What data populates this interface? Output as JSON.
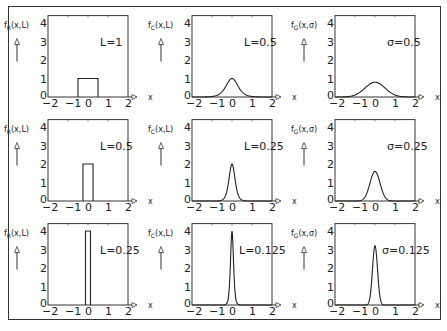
{
  "chart_data": [
    {
      "type": "line",
      "panel": "row1-col1",
      "ylabel": "f_R(x,L)",
      "xlabel": "x",
      "annotation": "L=1",
      "shape": "rect",
      "param": 1,
      "peak": 1,
      "xlim": [
        -2,
        2
      ],
      "ylim": [
        0,
        4.4
      ],
      "xticks": [
        "-2",
        "-1",
        "0",
        "1",
        "2"
      ],
      "yticks": [
        "0",
        "1",
        "2",
        "3",
        "4"
      ]
    },
    {
      "type": "line",
      "panel": "row1-col2",
      "ylabel": "f_C(x,L)",
      "xlabel": "x",
      "annotation": "L=0.5",
      "shape": "lorentz",
      "param": 0.5,
      "peak": 1,
      "xlim": [
        -2,
        2
      ],
      "ylim": [
        0,
        4.4
      ],
      "xticks": [
        "-2",
        "-1",
        "0",
        "1",
        "2"
      ],
      "yticks": [
        "0",
        "1",
        "2",
        "3",
        "4"
      ]
    },
    {
      "type": "line",
      "panel": "row1-col3",
      "ylabel": "f_G(x,σ)",
      "xlabel": "x",
      "annotation": "σ=0.5",
      "shape": "gauss",
      "param": 0.5,
      "peak": 0.8,
      "xlim": [
        -2,
        2
      ],
      "ylim": [
        0,
        4.4
      ],
      "xticks": [
        "-2",
        "-1",
        "0",
        "1",
        "2"
      ],
      "yticks": [
        "0",
        "1",
        "2",
        "3",
        "4"
      ]
    },
    {
      "type": "line",
      "panel": "row2-col1",
      "ylabel": "f_R(x,L)",
      "xlabel": "x",
      "annotation": "L=0.5",
      "shape": "rect",
      "param": 0.5,
      "peak": 2,
      "xlim": [
        -2,
        2
      ],
      "ylim": [
        0,
        4.4
      ],
      "xticks": [
        "-2",
        "-1",
        "0",
        "1",
        "2"
      ],
      "yticks": [
        "0",
        "1",
        "2",
        "3",
        "4"
      ]
    },
    {
      "type": "line",
      "panel": "row2-col2",
      "ylabel": "f_C(x,L)",
      "xlabel": "x",
      "annotation": "L=0.25",
      "shape": "lorentz",
      "param": 0.25,
      "peak": 2,
      "xlim": [
        -2,
        2
      ],
      "ylim": [
        0,
        4.4
      ],
      "xticks": [
        "-2",
        "-1",
        "0",
        "1",
        "2"
      ],
      "yticks": [
        "0",
        "1",
        "2",
        "3",
        "4"
      ]
    },
    {
      "type": "line",
      "panel": "row2-col3",
      "ylabel": "f_G(x,σ)",
      "xlabel": "x",
      "annotation": "σ=0.25",
      "shape": "gauss",
      "param": 0.25,
      "peak": 1.6,
      "xlim": [
        -2,
        2
      ],
      "ylim": [
        0,
        4.4
      ],
      "xticks": [
        "-2",
        "-1",
        "0",
        "1",
        "2"
      ],
      "yticks": [
        "0",
        "1",
        "2",
        "3",
        "4"
      ]
    },
    {
      "type": "line",
      "panel": "row3-col1",
      "ylabel": "f_R(x,L)",
      "xlabel": "x",
      "annotation": "L=0.25",
      "shape": "rect",
      "param": 0.25,
      "peak": 4,
      "xlim": [
        -2,
        2
      ],
      "ylim": [
        0,
        4.4
      ],
      "xticks": [
        "-2",
        "-1",
        "0",
        "1",
        "2"
      ],
      "yticks": [
        "0",
        "1",
        "2",
        "3",
        "4"
      ]
    },
    {
      "type": "line",
      "panel": "row3-col2",
      "ylabel": "f_C(x,L)",
      "xlabel": "x",
      "annotation": "L=0.125",
      "shape": "lorentz",
      "param": 0.125,
      "peak": 4,
      "xlim": [
        -2,
        2
      ],
      "ylim": [
        0,
        4.4
      ],
      "xticks": [
        "-2",
        "-1",
        "0",
        "1",
        "2"
      ],
      "yticks": [
        "0",
        "1",
        "2",
        "3",
        "4"
      ]
    },
    {
      "type": "line",
      "panel": "row3-col3",
      "ylabel": "f_G(x,σ)",
      "xlabel": "x",
      "annotation": "σ=0.125",
      "shape": "gauss",
      "param": 0.125,
      "peak": 3.2,
      "xlim": [
        -2,
        2
      ],
      "ylim": [
        0,
        4.4
      ],
      "xticks": [
        "-2",
        "-1",
        "0",
        "1",
        "2"
      ],
      "yticks": [
        "0",
        "1",
        "2",
        "3",
        "4"
      ]
    }
  ],
  "layout": {
    "col_left": [
      48,
      192,
      335
    ],
    "col_width": 80,
    "row_axis": [
      97,
      201,
      305
    ],
    "unit_y": 18.5
  }
}
